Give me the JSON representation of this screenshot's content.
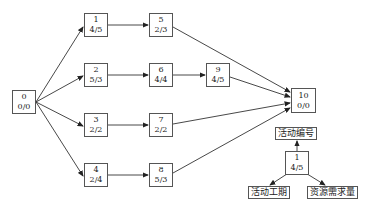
{
  "diagram": {
    "type": "activity-on-node network",
    "nodes": [
      {
        "id": "0",
        "number": "0",
        "value": "0/0",
        "x": 12,
        "y": 90
      },
      {
        "id": "1",
        "number": "1",
        "value": "4/5",
        "x": 84,
        "y": 13
      },
      {
        "id": "2",
        "number": "2",
        "value": "5/3",
        "x": 84,
        "y": 63
      },
      {
        "id": "3",
        "number": "3",
        "value": "2/2",
        "x": 84,
        "y": 113
      },
      {
        "id": "4",
        "number": "4",
        "value": "2/4",
        "x": 84,
        "y": 163
      },
      {
        "id": "5",
        "number": "5",
        "value": "2/3",
        "x": 149,
        "y": 13
      },
      {
        "id": "6",
        "number": "6",
        "value": "4/4",
        "x": 149,
        "y": 63
      },
      {
        "id": "7",
        "number": "7",
        "value": "2/2",
        "x": 149,
        "y": 113
      },
      {
        "id": "8",
        "number": "8",
        "value": "5/3",
        "x": 149,
        "y": 163
      },
      {
        "id": "9",
        "number": "9",
        "value": "4/5",
        "x": 206,
        "y": 63
      },
      {
        "id": "10",
        "number": "10",
        "value": "0/0",
        "x": 291,
        "y": 88
      }
    ],
    "edges": [
      [
        "0",
        "1"
      ],
      [
        "0",
        "2"
      ],
      [
        "0",
        "3"
      ],
      [
        "0",
        "4"
      ],
      [
        "1",
        "5"
      ],
      [
        "2",
        "6"
      ],
      [
        "6",
        "9"
      ],
      [
        "3",
        "7"
      ],
      [
        "4",
        "8"
      ],
      [
        "5",
        "10"
      ],
      [
        "9",
        "10"
      ],
      [
        "7",
        "10"
      ],
      [
        "8",
        "10"
      ]
    ]
  },
  "legend": {
    "sample_node": {
      "number": "1",
      "value": "4/5"
    },
    "activity_number_label": "活动编号",
    "duration_label": "活动工期",
    "resource_label": "资源需求量"
  }
}
